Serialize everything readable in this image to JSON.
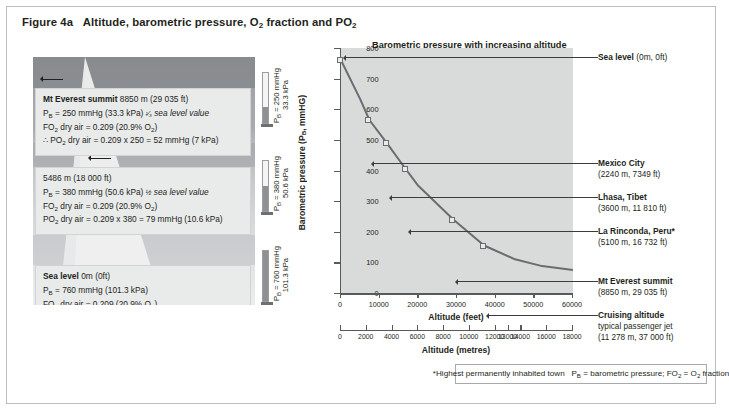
{
  "figure": {
    "label": "Figure 4a"
  },
  "left_panel": {
    "blocks": [
      {
        "name": "Mt Everest summit",
        "altitude": "8850 m (29 035 ft)",
        "pb": "P_B = 250 mmHg (33.3 kPa) 1/3 sea level value",
        "fo2": "FO₂ dry air = 0.209 (20.9% O₂)",
        "po2": "∴ PO₂ dry air = 0.209 x 250 = 52 mmHg (7 kPa)",
        "gauge_top": "P_B = 250 mmHg",
        "gauge_kpa": "33.3 kPa",
        "fill_pct": 33
      },
      {
        "name": "",
        "altitude": "5486 m (18 000 ft)",
        "pb": "P_B = 380 mmHg (50.6 kPa) 1/2 sea level value",
        "fo2": "FO₂ dry air = 0.209 (20.9% O₂)",
        "po2": "PO₂ dry air = 0.209 x 380 = 79 mmHg (10.6 kPa)",
        "gauge_top": "P_B = 380 mmHg",
        "gauge_kpa": "50.6 kPa",
        "fill_pct": 50
      },
      {
        "name": "Sea level",
        "altitude": "0m (0ft)",
        "pb": "P_B = 760 mmHg (101.3 kPa)",
        "fo2": "FO₂ dry air = 0.209 (20.9% O₂)",
        "po2": "PO₂ dry air = 0.209 x 760 = 159 mmHg (21 kPa)",
        "gauge_top": "P_B = 760 mmHg",
        "gauge_kpa": "101.3 kPa",
        "fill_pct": 100
      }
    ]
  },
  "chart_data": {
    "type": "line",
    "title": "Barometric pressure with increasing altitude",
    "xlabel": "Altitude (feet)",
    "ylabel": "Barometric pressure (P_B, mmHG)",
    "secondary_xlabel": "Altitude (metres)",
    "xlim": [
      0,
      60000
    ],
    "ylim": [
      0,
      800
    ],
    "grid": false,
    "yticks": [
      0,
      100,
      200,
      300,
      400,
      500,
      600,
      700,
      800
    ],
    "xticks": [
      0,
      10000,
      20000,
      30000,
      40000,
      50000,
      60000
    ],
    "metre_ticks": [
      0,
      2000,
      4000,
      6000,
      8000,
      10000,
      12000,
      13000,
      14000,
      16000,
      18000
    ],
    "x": [
      0,
      5000,
      7349,
      11810,
      16732,
      20000,
      29035,
      37000,
      45000,
      52000,
      60000
    ],
    "y": [
      760,
      632,
      565,
      490,
      405,
      350,
      240,
      155,
      110,
      88,
      75
    ],
    "points": [
      {
        "label": "Sea level",
        "x": 0,
        "y": 760
      },
      {
        "label": "Mexico City",
        "x": 7349,
        "y": 565
      },
      {
        "label": "Lhasa, Tibet",
        "x": 11810,
        "y": 490
      },
      {
        "label": "La Rinconda, Peru*",
        "x": 16732,
        "y": 405
      },
      {
        "label": "Mt Everest summit",
        "x": 29035,
        "y": 240
      },
      {
        "label": "Cruising altitude",
        "x": 37000,
        "y": 155
      }
    ]
  },
  "annotations": [
    {
      "name": "Sea level",
      "suffix": "(0m, 0ft)",
      "detail": "",
      "detail2": ""
    },
    {
      "name": "Mexico City",
      "suffix": "",
      "detail": "(2240 m, 7349 ft)",
      "detail2": ""
    },
    {
      "name": "Lhasa, Tibet",
      "suffix": "",
      "detail": "(3600 m, 11 810 ft)",
      "detail2": ""
    },
    {
      "name": "La Rinconda, Peru*",
      "suffix": "",
      "detail": "(5100 m, 16 732 ft)",
      "detail2": ""
    },
    {
      "name": "Mt Everest summit",
      "suffix": "",
      "detail": "(8850 m, 29 035 ft)",
      "detail2": ""
    },
    {
      "name": "Cruising altitude",
      "suffix": "",
      "detail": "typical passenger jet",
      "detail2": "(11 278 m, 37 000 ft)"
    }
  ],
  "footnote": {
    "text": "*Highest permanently inhabited town    P_B = barometric pressure; FO₂ = O₂ fraction"
  }
}
